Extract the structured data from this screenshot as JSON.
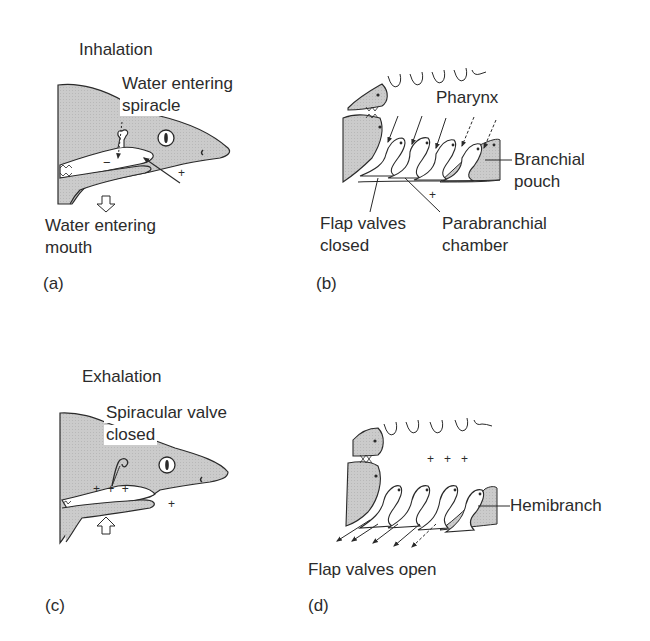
{
  "panels": {
    "a": {
      "letter": "(a)",
      "title": "Inhalation",
      "label_spiracle_line1": "Water entering",
      "label_spiracle_line2": "spiracle",
      "label_mouth_line1": "Water entering",
      "label_mouth_line2": "mouth",
      "pressure_inside": "−",
      "pressure_outside": "+"
    },
    "b": {
      "letter": "(b)",
      "label_pharynx": "Pharynx",
      "label_branchial_line1": "Branchial",
      "label_branchial_line2": "pouch",
      "label_flap_line1": "Flap valves",
      "label_flap_line2": "closed",
      "label_para_line1": "Parabranchial",
      "label_para_line2": "chamber",
      "pressure_outside": "+"
    },
    "c": {
      "letter": "(c)",
      "title": "Exhalation",
      "label_valve_line1": "Spiracular valve",
      "label_valve_line2": "closed",
      "pressure_inside": "+ + +",
      "pressure_outside": "+"
    },
    "d": {
      "letter": "(d)",
      "label_hemibranch": "Hemibranch",
      "label_flap": "Flap valves open",
      "pressure_pharynx": "+   +   +"
    }
  },
  "colors": {
    "shading": "#c8c8c8",
    "line": "#2a2a2a",
    "background": "#ffffff"
  }
}
